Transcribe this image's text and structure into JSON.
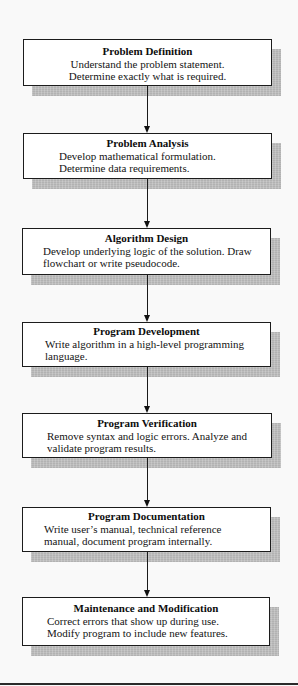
{
  "diagram": {
    "type": "flowchart",
    "direction": "top-to-bottom",
    "colors": {
      "box_fill": "#ffffff",
      "box_border": "#1c1c1c",
      "shadow": "#bdbdbd",
      "arrow": "#111111",
      "background": "#f9f9f9"
    },
    "boxes": [
      {
        "title": "Problem Definition",
        "lines": [
          "Understand the problem statement.",
          "Determine exactly what is required."
        ]
      },
      {
        "title": "Problem Analysis",
        "lines": [
          "Develop mathematical formulation.",
          "Determine data requirements."
        ]
      },
      {
        "title": "Algorithm Design",
        "lines": [
          "Develop underlying logic of the solution. Draw",
          "flowchart or write pseudocode."
        ]
      },
      {
        "title": "Program Development",
        "lines": [
          "Write algorithm in a high-level programming",
          "language."
        ]
      },
      {
        "title": "Program Verification",
        "lines": [
          "Remove syntax and logic errors. Analyze and",
          "validate program results."
        ]
      },
      {
        "title": "Program Documentation",
        "lines": [
          "Write user’s manual, technical reference",
          "manual, document program internally."
        ]
      },
      {
        "title": "Maintenance and Modification",
        "lines": [
          "Correct errors that show up during use.",
          "Modify program to include new features."
        ]
      }
    ],
    "edges": [
      {
        "from": "Problem Definition",
        "to": "Problem Analysis"
      },
      {
        "from": "Problem Analysis",
        "to": "Algorithm Design"
      },
      {
        "from": "Algorithm Design",
        "to": "Program Development"
      },
      {
        "from": "Program Development",
        "to": "Program Verification"
      },
      {
        "from": "Program Verification",
        "to": "Program Documentation"
      },
      {
        "from": "Program Documentation",
        "to": "Maintenance and Modification"
      }
    ]
  }
}
